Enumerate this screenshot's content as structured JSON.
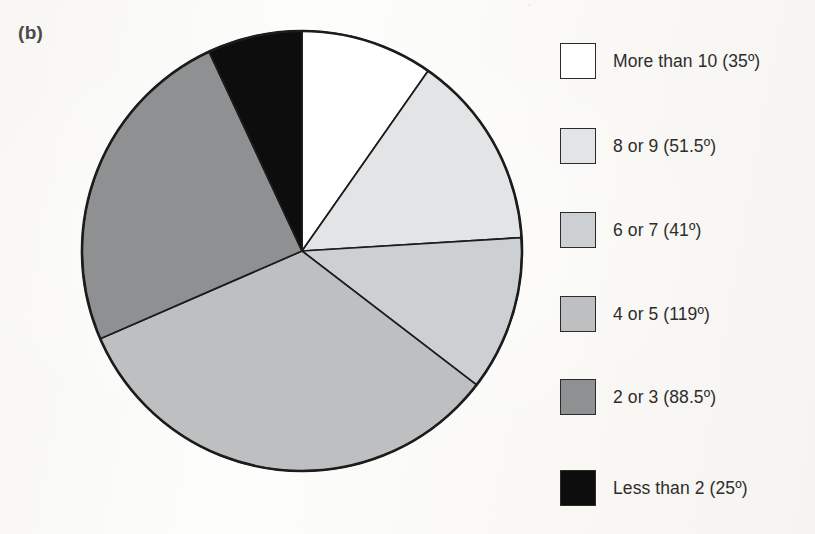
{
  "figure": {
    "panel_label": "(b)",
    "background_color": "#fbfaf8"
  },
  "chart_data": {
    "type": "pie",
    "title": "",
    "subtitle": "",
    "xlabel": "",
    "ylabel": "",
    "legend_position": "right",
    "grid": false,
    "units": "degrees",
    "start_angle_deg": 0,
    "direction": "clockwise",
    "total_deg": 360,
    "categories": [
      "More than 10",
      "8 or 9",
      "6 or 7",
      "4 or 5",
      "2 or 3",
      "Less than 2"
    ],
    "values": [
      35,
      51.5,
      41,
      119,
      88.5,
      25
    ],
    "value_labels": [
      "35º",
      "51.5º",
      "41º",
      "119º",
      "88.5º",
      "25º"
    ],
    "colors": [
      "#ffffff",
      "#e2e4e6",
      "#cdd0d2",
      "#bdbfc1",
      "#8e9092",
      "#0d0d0d"
    ],
    "slice_border_color": "#1c1c1c",
    "legend_entries": [
      "More than 10 (35º)",
      "8 or 9 (51.5º)",
      "6 or 7 (41º)",
      "4 or 5 (119º)",
      "2 or 3 (88.5º)",
      "Less than 2 (25º)"
    ]
  },
  "legend": {
    "items": [
      {
        "label": "More than 10 (35º)",
        "color": "#ffffff",
        "top": 43
      },
      {
        "label": "8 or 9 (51.5º)",
        "color": "#e2e4e6",
        "top": 128
      },
      {
        "label": "6 or 7 (41º)",
        "color": "#cdd0d2",
        "top": 212
      },
      {
        "label": "4 or 5 (119º)",
        "color": "#bdbfc1",
        "top": 296
      },
      {
        "label": "2 or 3 (88.5º)",
        "color": "#8e9092",
        "top": 379
      },
      {
        "label": "Less than 2 (25º)",
        "color": "#0d0d0d",
        "top": 470
      }
    ]
  }
}
